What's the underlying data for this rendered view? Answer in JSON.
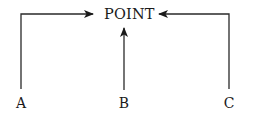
{
  "diagram": {
    "type": "flow",
    "target": {
      "label": "POINT"
    },
    "sources": [
      {
        "label": "A",
        "route": "up-then-right"
      },
      {
        "label": "B",
        "route": "straight-up"
      },
      {
        "label": "C",
        "route": "up-then-left"
      }
    ],
    "edges": [
      {
        "from": "A",
        "to": "POINT"
      },
      {
        "from": "B",
        "to": "POINT"
      },
      {
        "from": "C",
        "to": "POINT"
      }
    ],
    "colors": {
      "line": "#2a2a2a",
      "text": "#1a1a1a",
      "background": "#ffffff"
    }
  }
}
